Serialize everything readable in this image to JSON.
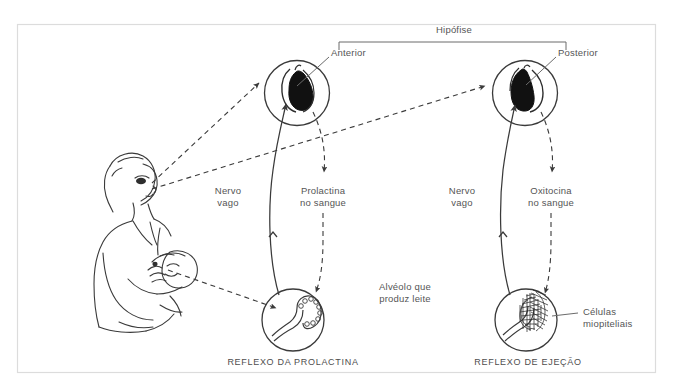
{
  "figure": {
    "title": "Hipófise",
    "frame": {
      "color": "#d8d8d8"
    },
    "ink_color": "#3a3a3a",
    "text_color": "#555555"
  },
  "labels": {
    "hipofise": "Hipófise",
    "anterior": "Anterior",
    "posterior": "Posterior",
    "nervo_vago_left": "Nervo\nvago",
    "nervo_vago_right": "Nervo\nvago",
    "prolactina": "Prolactina\nno sangue",
    "oxitocina": "Oxitocina\nno sangue",
    "alveolo": "Alvéolo que\nproduz leite",
    "celulas": "Células\nmiopiteliais"
  },
  "captions": {
    "left": "REFLEXO DA PROLACTINA",
    "right": "REFLEXO DE EJEÇÃO"
  },
  "nodes": {
    "mother": "nursing-mother-illustration",
    "anterior_pituitary": "anterior-pituitary-circle",
    "posterior_pituitary": "posterior-pituitary-circle",
    "alveolus_left": "milk-producing-alveolus-circle",
    "alveolus_right": "myoepithelial-alveolus-circle"
  },
  "arrows": [
    {
      "name": "suckling-to-anterior",
      "style": "dashed",
      "from": "mother-head",
      "to": "anterior-pituitary"
    },
    {
      "name": "suckling-to-posterior",
      "style": "dashed",
      "from": "mother-head",
      "to": "posterior-pituitary"
    },
    {
      "name": "anterior-to-alveolus",
      "style": "dashed",
      "from": "anterior-pituitary",
      "to": "left-alveolus"
    },
    {
      "name": "posterior-to-alveolus",
      "style": "dashed",
      "from": "posterior-pituitary",
      "to": "right-alveolus"
    },
    {
      "name": "breast-to-left-alveolus",
      "style": "dashed",
      "from": "breast",
      "to": "left-alveolus"
    },
    {
      "name": "vagus-nerve-left",
      "style": "solid",
      "from": "left-alveolus",
      "to": "anterior-pituitary"
    },
    {
      "name": "vagus-nerve-right",
      "style": "solid",
      "from": "right-alveolus",
      "to": "posterior-pituitary"
    }
  ]
}
